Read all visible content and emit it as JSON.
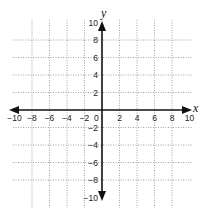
{
  "diagram": {
    "type": "coordinate-plane",
    "axis_labels": {
      "x": "x",
      "y": "y"
    },
    "origin_label": "0",
    "x_tick_labels": [
      "−10",
      "−8",
      "−6",
      "−4",
      "−2",
      "2",
      "4",
      "6",
      "8",
      "10"
    ],
    "x_tick_values": [
      -10,
      -8,
      -6,
      -4,
      -2,
      2,
      4,
      6,
      8,
      10
    ],
    "y_tick_labels": [
      "10",
      "8",
      "6",
      "4",
      "2",
      "−2",
      "−4",
      "−6",
      "−8",
      "−10"
    ],
    "y_tick_values": [
      10,
      8,
      6,
      4,
      2,
      -2,
      -4,
      -6,
      -8,
      -10
    ],
    "range": {
      "x": [
        -10,
        10
      ],
      "y": [
        -10,
        10
      ]
    },
    "grid": {
      "spacing": 2,
      "style": "dotted",
      "color": "#8a8a8a"
    },
    "axis_color": "#111111"
  }
}
